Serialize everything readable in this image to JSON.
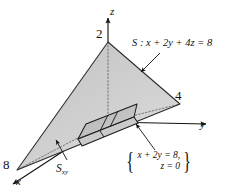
{
  "figure": {
    "kind": "3d-coordinate-diagram",
    "axes": {
      "x": {
        "label": "x",
        "intercept_label": "8",
        "intercept_value": 8
      },
      "y": {
        "label": "y",
        "intercept_label": "4",
        "intercept_value": 4
      },
      "z": {
        "label": "z",
        "intercept_label": "2",
        "intercept_value": 2
      }
    },
    "annotations": {
      "surface": {
        "name": "S",
        "separator": " : ",
        "equation": "x + 2y + 4z = 8",
        "full": "S : x + 2y + 4z = 8"
      },
      "projection": {
        "base": "S",
        "subscript": "xy",
        "full": "Sxy"
      },
      "trace_system": {
        "left_brace": "{",
        "right_brace": "}",
        "line1": "x + 2y = 8,",
        "line2": "z = 0"
      }
    },
    "colors": {
      "background": "#ffffff",
      "ink": "#111111",
      "face_back": "#b9b9b9",
      "face_front": "#cfcfcf",
      "face_base": "#d9d9d9",
      "strip_fill": "#c2c2c2",
      "axis": "#1a1a1a",
      "hidden_line": "#6e6e6e"
    }
  }
}
